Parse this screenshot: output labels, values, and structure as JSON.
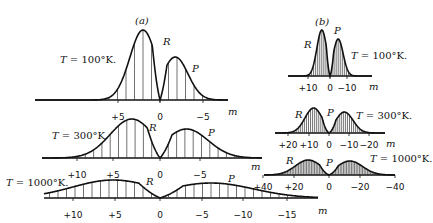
{
  "chart_data": [
    {
      "type": "area",
      "panel": "(a)",
      "title": "T = 100°K.",
      "xlabel": "m",
      "x_ticks": [
        "+5",
        "0",
        "-5"
      ],
      "branches": [
        "R",
        "P"
      ],
      "geom": {
        "baseline": 100,
        "zero_x": 160,
        "unit_px": 8.5,
        "x_min": 35,
        "x_max": 228,
        "R": {
          "peak_m": 2,
          "height": 70,
          "width": 1.55
        },
        "P": {
          "peak_m": -1.8,
          "height": 43,
          "width": 1.5
        }
      },
      "series": [
        {
          "name": "R",
          "peak_m": 2,
          "relative_peak": 1.0
        },
        {
          "name": "P",
          "peak_m": -2,
          "relative_peak": 0.6
        }
      ],
      "labels_pos": {
        "title": [
          60,
          63
        ],
        "panel": [
          135,
          24
        ],
        "R": [
          163,
          45
        ],
        "P": [
          192,
          72
        ],
        "m": [
          228,
          115
        ]
      }
    },
    {
      "type": "area",
      "panel": "(a)",
      "title": "T = 300°K.",
      "xlabel": "m",
      "x_ticks": [
        "+10",
        "+5",
        "0",
        "-5"
      ],
      "branches": [
        "R",
        "P"
      ],
      "geom": {
        "baseline": 158,
        "zero_x": 160,
        "unit_px": 8.3,
        "x_min": 42,
        "x_max": 262,
        "R": {
          "peak_m": 3.4,
          "height": 39,
          "width": 2.6
        },
        "P": {
          "peak_m": -3.2,
          "height": 29,
          "width": 2.6
        }
      },
      "series": [
        {
          "name": "R",
          "peak_m": 3.5,
          "relative_peak": 1.0
        },
        {
          "name": "P",
          "peak_m": -3.5,
          "relative_peak": 0.75
        }
      ],
      "labels_pos": {
        "title": [
          52,
          139
        ],
        "R": [
          149,
          131
        ],
        "P": [
          208,
          136
        ],
        "m": [
          251,
          170
        ]
      }
    },
    {
      "type": "area",
      "panel": "(a)",
      "title": "T = 1000°K.",
      "xlabel": "m",
      "x_ticks": [
        "+10",
        "+5",
        "0",
        "-5",
        "-10",
        "-15"
      ],
      "branches": [
        "R",
        "P"
      ],
      "geom": {
        "baseline": 198,
        "zero_x": 160,
        "unit_px": 8.5,
        "x_min": 44,
        "x_max": 318,
        "R": {
          "peak_m": 5.5,
          "height": 18,
          "width": 4.8
        },
        "P": {
          "peak_m": -6,
          "height": 15,
          "width": 5.0
        }
      },
      "series": [
        {
          "name": "R",
          "peak_m": 5.5,
          "relative_peak": 1.0
        },
        {
          "name": "P",
          "peak_m": -6,
          "relative_peak": 0.85
        }
      ],
      "labels_pos": {
        "title": [
          6,
          186
        ],
        "R": [
          146,
          185
        ],
        "P": [
          228,
          182
        ],
        "m": [
          318,
          214
        ]
      }
    },
    {
      "type": "area",
      "panel": "(b)",
      "title": "T = 100°K.",
      "xlabel": "m",
      "x_ticks": [
        "+10",
        "0",
        "-10"
      ],
      "branches": [
        "R",
        "P"
      ],
      "geom": {
        "baseline": 76,
        "zero_x": 330,
        "unit_px": 2.05,
        "x_min": 288,
        "x_max": 372,
        "R": {
          "peak_m": 4,
          "height": 46,
          "width": 2.4
        },
        "P": {
          "peak_m": -4,
          "height": 37,
          "width": 2.4
        }
      },
      "series": [
        {
          "name": "R",
          "peak_m": 4,
          "relative_peak": 1.0
        },
        {
          "name": "P",
          "peak_m": -4,
          "relative_peak": 0.8
        }
      ],
      "labels_pos": {
        "title": [
          351,
          59
        ],
        "panel": [
          315,
          25
        ],
        "R": [
          304,
          48
        ],
        "P": [
          334,
          34
        ],
        "m": [
          369,
          90
        ]
      }
    },
    {
      "type": "area",
      "panel": "(b)",
      "title": "T = 300°K.",
      "xlabel": "m",
      "x_ticks": [
        "+20",
        "+10",
        "0",
        "-10",
        "-20"
      ],
      "branches": [
        "R",
        "P"
      ],
      "geom": {
        "baseline": 133,
        "zero_x": 329,
        "unit_px": 2.05,
        "x_min": 275,
        "x_max": 385,
        "R": {
          "peak_m": 7.5,
          "height": 25,
          "width": 4.2
        },
        "P": {
          "peak_m": -7.5,
          "height": 21,
          "width": 4.2
        }
      },
      "series": [
        {
          "name": "R",
          "peak_m": 7.5,
          "relative_peak": 1.0
        },
        {
          "name": "P",
          "peak_m": -7.5,
          "relative_peak": 0.85
        }
      ],
      "labels_pos": {
        "title": [
          356,
          119
        ],
        "R": [
          295,
          118
        ],
        "P": [
          327,
          116
        ],
        "m": [
          386,
          147
        ]
      }
    },
    {
      "type": "area",
      "panel": "(b)",
      "title": "T = 1000°K.",
      "xlabel": "m",
      "x_ticks": [
        "+40",
        "+20",
        "0",
        "-20",
        "-40"
      ],
      "branches": [
        "R",
        "P"
      ],
      "geom": {
        "baseline": 175,
        "zero_x": 329,
        "unit_px": 1.6,
        "x_min": 264,
        "x_max": 395,
        "R": {
          "peak_m": 13,
          "height": 15,
          "width": 8
        },
        "P": {
          "peak_m": -13,
          "height": 14,
          "width": 8
        }
      },
      "series": [
        {
          "name": "R",
          "peak_m": 13,
          "relative_peak": 1.0
        },
        {
          "name": "P",
          "peak_m": -13,
          "relative_peak": 0.93
        }
      ],
      "labels_pos": {
        "title": [
          370,
          162
        ],
        "R": [
          286,
          164
        ],
        "P": [
          326,
          166
        ],
        "m": [
          0,
          0
        ]
      }
    }
  ],
  "tick_positions": [
    [
      118,
      160,
      203
    ],
    [
      77,
      113,
      160,
      200
    ],
    [
      73,
      115,
      160,
      202,
      243,
      287
    ],
    [
      308,
      330,
      347
    ],
    [
      288,
      309,
      329,
      349,
      369
    ],
    [
      263,
      294,
      329,
      360,
      395
    ]
  ],
  "tick_label_y": [
    120,
    178,
    218,
    91,
    148,
    190
  ]
}
